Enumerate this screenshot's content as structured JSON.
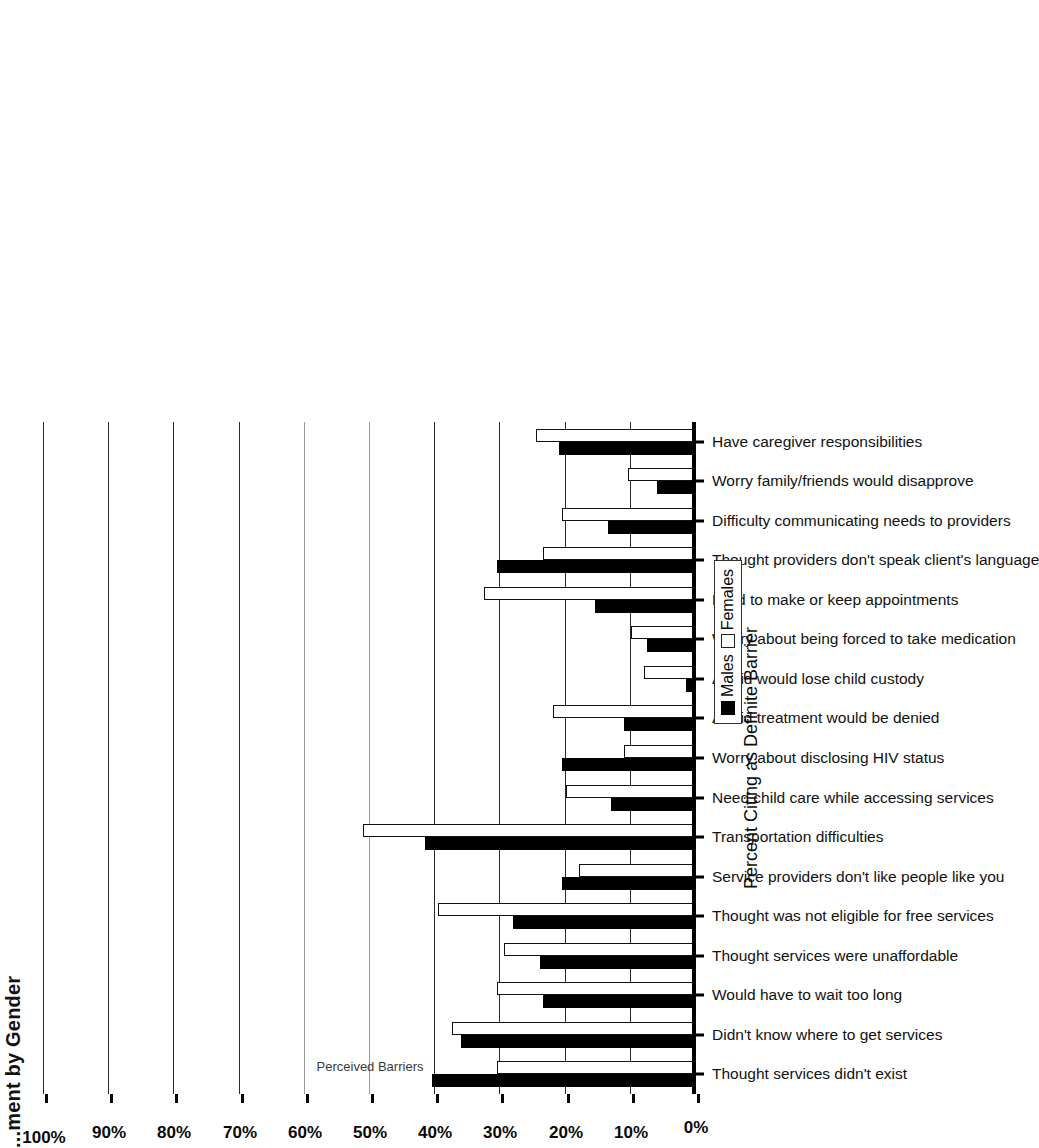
{
  "figure": {
    "title": "...ment by Gender",
    "title_note": "cropped at left edge of scan"
  },
  "legend": {
    "position": "below-axis-right",
    "items": [
      {
        "label": "Males",
        "swatch": "filled-black"
      },
      {
        "label": "Females",
        "swatch": "open-white"
      }
    ]
  },
  "chart_data": {
    "type": "bar",
    "orientation": "vertical-rendered-rotated",
    "title": "...ment by Gender",
    "xlabel": "Perceived Barriers",
    "ylabel": "Percent Citing as Definite Barrier",
    "ylim": [
      0,
      100
    ],
    "ytick_labels": [
      "0%",
      "10%",
      "20%",
      "30%",
      "40%",
      "50%",
      "60%",
      "70%",
      "80%",
      "90%",
      "100%"
    ],
    "ytick_values": [
      0,
      10,
      20,
      30,
      40,
      50,
      60,
      70,
      80,
      90,
      100
    ],
    "grid": true,
    "legend_position": "bottom-right",
    "categories": [
      "Thought services didn't exist",
      "Didn't know where to get services",
      "Would have to wait too long",
      "Thought services were unaffordable",
      "Thought was not eligible for free services",
      "Service providers don't like people like you",
      "Transportation difficulties",
      "Need child care while accessing services",
      "Worry about disclosing HIV status",
      "Afraid treatment would be denied",
      "Afraid would lose child custody",
      "Worry about being forced to take medication",
      "Hard to make or keep appointments",
      "Thought providers don't speak client's language",
      "Difficulty communicating needs to providers",
      "Worry family/friends would disapprove",
      "Have caregiver responsibilities"
    ],
    "series": [
      {
        "name": "Males",
        "color": "#000000",
        "values": [
          40.5,
          36.0,
          23.5,
          24.0,
          28.0,
          20.5,
          41.5,
          13.0,
          20.5,
          11.0,
          1.5,
          7.5,
          15.5,
          30.5,
          13.5,
          6.0,
          21.0
        ]
      },
      {
        "name": "Females",
        "color": "#ffffff",
        "values": [
          30.5,
          37.5,
          30.5,
          29.5,
          39.5,
          18.0,
          51.0,
          20.0,
          11.0,
          22.0,
          8.0,
          10.0,
          32.5,
          23.5,
          20.5,
          10.5,
          24.5
        ]
      }
    ]
  }
}
